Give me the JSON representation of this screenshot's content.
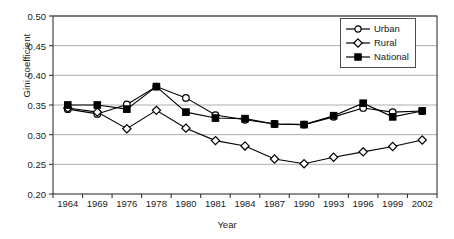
{
  "chart_data": {
    "type": "line",
    "title": "",
    "xlabel": "Year",
    "ylabel": "Gini coefficient",
    "categories": [
      "1964",
      "1969",
      "1976",
      "1978",
      "1980",
      "1981",
      "1984",
      "1987",
      "1990",
      "1993",
      "1996",
      "1999",
      "2002"
    ],
    "ylim": [
      0.2,
      0.5
    ],
    "yticks": [
      "0.50",
      "0.45",
      "0.40",
      "0.35",
      "0.30",
      "0.25",
      "0.20"
    ],
    "ytick_values": [
      0.5,
      0.45,
      0.4,
      0.35,
      0.3,
      0.25,
      0.2
    ],
    "grid": "horizontal",
    "legend_position": "top-right",
    "series": [
      {
        "name": "Urban",
        "marker": "open-circle",
        "color": "#000000",
        "values": [
          0.343,
          0.335,
          0.351,
          0.381,
          0.362,
          0.333,
          0.325,
          0.318,
          0.317,
          0.33,
          0.345,
          0.338,
          0.34
        ]
      },
      {
        "name": "Rural",
        "marker": "open-diamond",
        "color": "#000000",
        "values": [
          0.345,
          0.338,
          0.31,
          0.341,
          0.311,
          0.29,
          0.281,
          0.259,
          0.251,
          0.262,
          0.271,
          0.28,
          0.291
        ]
      },
      {
        "name": "National",
        "marker": "filled-square",
        "color": "#000000",
        "values": [
          0.35,
          0.35,
          0.343,
          0.381,
          0.338,
          0.328,
          0.327,
          0.318,
          0.317,
          0.332,
          0.353,
          0.33,
          0.34
        ]
      }
    ]
  },
  "legend": {
    "items": [
      {
        "label": "Urban"
      },
      {
        "label": "Rural"
      },
      {
        "label": "National"
      }
    ]
  },
  "axes": {
    "frame_color": "#333333",
    "grid_color": "#999999"
  }
}
